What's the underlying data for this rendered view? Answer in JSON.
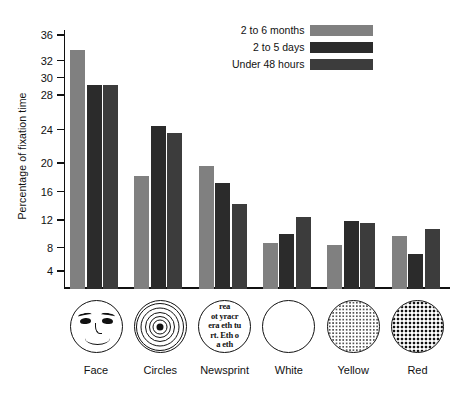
{
  "chart_data": {
    "type": "bar",
    "title": "",
    "xlabel": "",
    "ylabel": "Percentage of fixation time",
    "ylim": [
      0,
      37
    ],
    "grid": false,
    "legend_position": "top-right",
    "categories": [
      "Face",
      "Circles",
      "Newsprint",
      "White",
      "Yellow",
      "Red"
    ],
    "tick_labels": [
      "36",
      "32",
      "30",
      "28",
      "24",
      "20",
      "16",
      "12",
      "8",
      "4"
    ],
    "tick_values": [
      36,
      32,
      30,
      28,
      24,
      20,
      16,
      12,
      8,
      4
    ],
    "series": [
      {
        "name": "2 to 6 months",
        "color": "#808080",
        "values": [
          34.0,
          18.4,
          19.9,
          9.0,
          8.6,
          9.9
        ]
      },
      {
        "name": "2 to 5 days",
        "color": "#2b2b2b",
        "values": [
          29.4,
          24.6,
          17.5,
          10.3,
          12.1,
          7.2
        ]
      },
      {
        "name": "Under 48 hours",
        "color": "#3c3c3c",
        "values": [
          29.4,
          23.8,
          14.5,
          12.7,
          11.9,
          11.0
        ]
      }
    ]
  },
  "legend": {
    "items": [
      {
        "label": "2 to 6 months",
        "color": "#808080"
      },
      {
        "label": "2 to 5 days",
        "color": "#2b2b2b"
      },
      {
        "label": "Under 48 hours",
        "color": "#3c3c3c"
      }
    ]
  },
  "axis": {
    "y_title": "Percentage of fixation time"
  },
  "stimuli": [
    {
      "label": "Face",
      "icon": "smiley-face-circle-icon",
      "lines": []
    },
    {
      "label": "Circles",
      "icon": "concentric-circles-icon",
      "lines": []
    },
    {
      "label": "Newsprint",
      "icon": "newsprint-text-circle-icon",
      "lines": [
        "rea",
        "ot yracr",
        "era eth tu",
        "rt. Eth o",
        "a eth"
      ]
    },
    {
      "label": "White",
      "icon": "white-disc-icon",
      "lines": []
    },
    {
      "label": "Yellow",
      "icon": "yellow-stippled-disc-icon",
      "lines": []
    },
    {
      "label": "Red",
      "icon": "red-crosshatch-disc-icon",
      "lines": []
    }
  ]
}
